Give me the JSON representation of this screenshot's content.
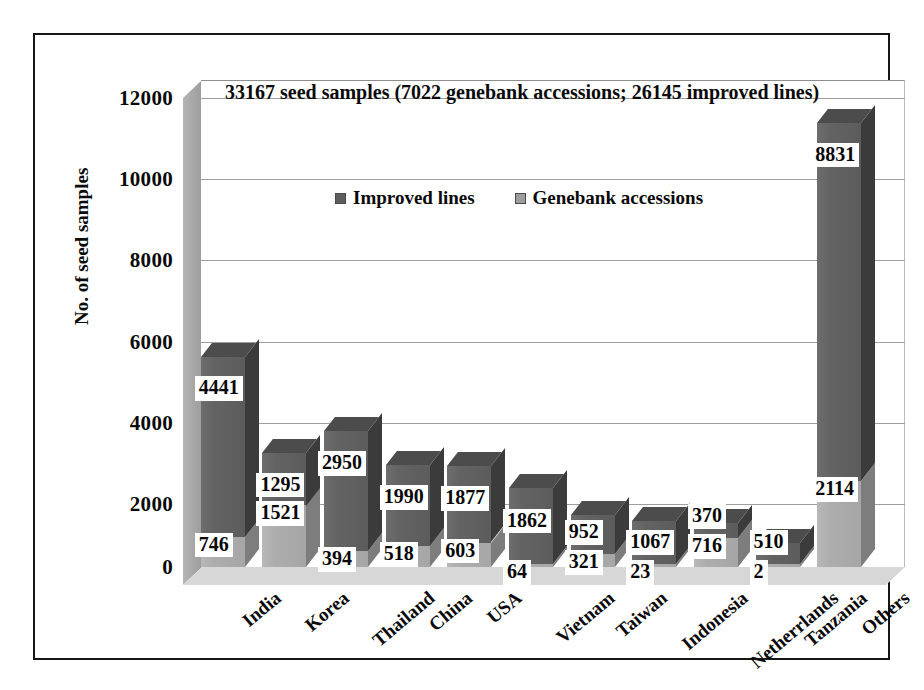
{
  "chart_data": {
    "type": "bar",
    "subtype": "stacked-3d-column",
    "title": "33167 seed samples (7022 genebank accessions; 26145 improved lines)",
    "xlabel": "",
    "ylabel": "No. of seed samples",
    "ylim": [
      0,
      12000
    ],
    "ytick_labels": [
      "12000",
      "10000",
      "8000",
      "6000",
      "4000",
      "2000",
      "0"
    ],
    "ytick_values": [
      12000,
      10000,
      8000,
      6000,
      4000,
      2000,
      0
    ],
    "grid": true,
    "legend_position": "inside-top-center",
    "categories": [
      "India",
      "Korea",
      "Thailand",
      "China",
      "USA",
      "Vietnam",
      "Taiwan",
      "Indonesia",
      "Netherrlands",
      "Tanzania",
      "Others"
    ],
    "series": [
      {
        "name": "Genebank accessions",
        "color": "#adadad",
        "values": [
          746,
          1521,
          394,
          518,
          603,
          64,
          321,
          23,
          716,
          2,
          2114
        ]
      },
      {
        "name": "Improved lines",
        "color": "#636363",
        "values": [
          4441,
          1295,
          2950,
          1990,
          1877,
          1862,
          952,
          1067,
          370,
          510,
          8831
        ]
      }
    ],
    "totals": [
      5187,
      2816,
      3344,
      2508,
      2480,
      1926,
      1273,
      1090,
      1086,
      512,
      10945
    ],
    "summary": {
      "total_seed_samples": 33167,
      "total_genebank_accessions": 7022,
      "total_improved_lines": 26145
    }
  },
  "legend": {
    "entries": [
      {
        "label": "Improved lines",
        "swatch": "#5e5e5e"
      },
      {
        "label": "Genebank accessions",
        "swatch": "#9d9d9d"
      }
    ]
  }
}
